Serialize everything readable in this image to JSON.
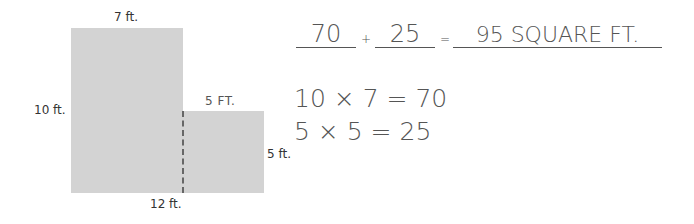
{
  "diagram": {
    "labels": {
      "top": "7 ft.",
      "left": "10 ft.",
      "step": "5 FT.",
      "right": "5 ft.",
      "bottom": "12 ft."
    },
    "colors": {
      "shape_fill": "#d3d3d3",
      "divider": "#666666",
      "text": "#555555"
    }
  },
  "equation": {
    "term1": "70",
    "plus": "+",
    "term2": "25",
    "equals": "=",
    "result": "95 SQUARE FT."
  },
  "work": {
    "line1": "10 × 7 = 70",
    "line2": "5 × 5 = 25"
  }
}
